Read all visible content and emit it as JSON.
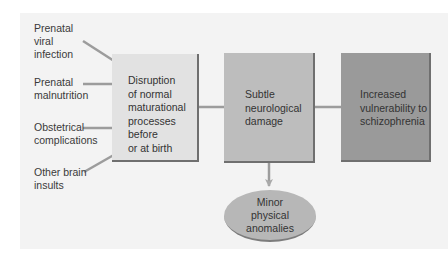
{
  "diagram": {
    "inputs": [
      {
        "label": "Prenatal viral infection",
        "lines": [
          "Prenatal",
          "viral",
          "infection"
        ]
      },
      {
        "label": "Prenatal malnutrition",
        "lines": [
          "Prenatal",
          "malnutrition"
        ]
      },
      {
        "label": "Obstetrical complications",
        "lines": [
          "Obstetrical",
          "complications"
        ]
      },
      {
        "label": "Other brain insults",
        "lines": [
          "Other brain",
          "insults"
        ]
      }
    ],
    "boxes": [
      {
        "label": "Disruption of normal maturational processes before or at birth",
        "lines": [
          "Disruption",
          "of normal",
          "maturational",
          "processes before",
          "or at birth"
        ],
        "color": "#e2e2e2"
      },
      {
        "label": "Subtle neurological damage",
        "lines": [
          "Subtle",
          "neurological",
          "damage"
        ],
        "color": "#bdbdbd"
      },
      {
        "label": "Increased vulnerability to schizophrenia",
        "lines": [
          "Increased",
          "vulnerability to",
          "schizophrenia"
        ],
        "color": "#9a9a9a"
      }
    ],
    "outcome": {
      "label": "Minor physical anomalies",
      "lines": [
        "Minor",
        "physical",
        "anomalies"
      ],
      "color": "#b7b7b7"
    },
    "arrow_color": "#999999"
  }
}
